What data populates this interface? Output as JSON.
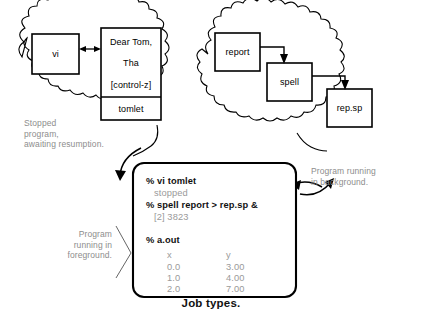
{
  "figure": {
    "caption": "Job types."
  },
  "clouds": {
    "left": {
      "name": "stopped-job-cloud",
      "annotation": "Stopped\nprogram,\nawaiting resumption.",
      "boxes": [
        {
          "id": "vi",
          "label": "vi"
        },
        {
          "id": "editor-buffer",
          "lines": [
            "Dear Tom,",
            "Tha",
            "[control-z]"
          ],
          "filename": "tomlet"
        }
      ]
    },
    "right": {
      "name": "background-job-cloud",
      "annotation": "Program running\nin background.",
      "boxes": [
        {
          "id": "report",
          "label": "report"
        },
        {
          "id": "spell",
          "label": "spell"
        },
        {
          "id": "repsp",
          "label": "rep.sp"
        }
      ]
    }
  },
  "foreground_annotation": "Program\nrunning in\nforeground.",
  "terminal": {
    "name": "terminal-window",
    "lines": [
      {
        "text": "% vi tomlet",
        "kind": "command"
      },
      {
        "text": "   stopped",
        "kind": "output"
      },
      {
        "text": "% spell report > rep.sp &",
        "kind": "command"
      },
      {
        "text": "   [2] 3823",
        "kind": "output"
      },
      {
        "text": "% a.out",
        "kind": "command"
      }
    ],
    "table": {
      "headers": [
        "x",
        "y"
      ],
      "rows": [
        [
          "0.0",
          "3.00"
        ],
        [
          "1.0",
          "4.00"
        ],
        [
          "2.0",
          "7.00"
        ]
      ]
    }
  },
  "colors": {
    "ink": "#000000",
    "gray_text": "#8d8d8d",
    "background": "#ffffff"
  }
}
